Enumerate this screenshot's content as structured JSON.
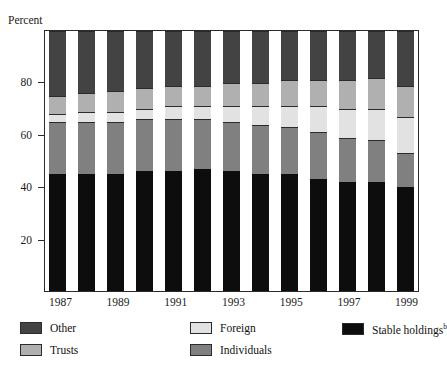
{
  "figure": {
    "cut_title": "",
    "y_axis_title": "Percent"
  },
  "axes": {
    "y_ticks": [
      20,
      40,
      60,
      80
    ],
    "x_tick_labels": [
      "1987",
      "1989",
      "1991",
      "1993",
      "1995",
      "1997",
      "1999"
    ]
  },
  "legend": {
    "items": [
      {
        "label": "Other",
        "color": "#434343"
      },
      {
        "label": "Trusts",
        "color": "#b0b0b0"
      },
      {
        "label": "Foreign",
        "color": "#e2e2e2"
      },
      {
        "label": "Individuals",
        "color": "#808080"
      },
      {
        "label": "Stable holdings",
        "sup": "b",
        "color": "#0d0d0d"
      }
    ]
  },
  "chart_data": {
    "type": "bar",
    "stacked": true,
    "title": "",
    "xlabel": "",
    "ylabel": "Percent",
    "ylim": [
      0,
      100
    ],
    "grid": false,
    "legend_position": "below",
    "categories": [
      "1987",
      "1988",
      "1989",
      "1990",
      "1991",
      "1992",
      "1993",
      "1994",
      "1995",
      "1996",
      "1997",
      "1998",
      "1999"
    ],
    "series": [
      {
        "name": "Stable holdings",
        "color": "#0d0d0d",
        "values": [
          45,
          45,
          45,
          46,
          46,
          47,
          46,
          45,
          45,
          43,
          42,
          42,
          40
        ]
      },
      {
        "name": "Individuals",
        "color": "#808080",
        "values": [
          20,
          20,
          20,
          20,
          20,
          19,
          19,
          19,
          18,
          18,
          17,
          16,
          13
        ]
      },
      {
        "name": "Foreign",
        "color": "#e2e2e2",
        "values": [
          3,
          4,
          4,
          4,
          5,
          5,
          6,
          7,
          8,
          10,
          11,
          12,
          14
        ]
      },
      {
        "name": "Trusts",
        "color": "#b0b0b0",
        "values": [
          7,
          7,
          8,
          8,
          8,
          8,
          9,
          9,
          10,
          10,
          11,
          12,
          12
        ]
      },
      {
        "name": "Other",
        "color": "#434343",
        "values": [
          25,
          24,
          23,
          22,
          21,
          21,
          20,
          20,
          19,
          19,
          19,
          18,
          21
        ]
      }
    ]
  }
}
